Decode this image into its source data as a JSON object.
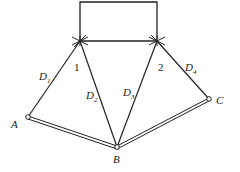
{
  "diagram": {
    "nodes": {
      "n1": {
        "label": "1",
        "x": 80,
        "y": 41
      },
      "n2": {
        "label": "2",
        "x": 157,
        "y": 41
      },
      "A": {
        "label": "A",
        "x": 28,
        "y": 117
      },
      "B": {
        "label": "B",
        "x": 117,
        "y": 147
      },
      "C": {
        "label": "C",
        "x": 209,
        "y": 99
      }
    },
    "members": [
      {
        "name": "D",
        "sub": "1",
        "from": "A",
        "to": "n1"
      },
      {
        "name": "D",
        "sub": "2",
        "from": "B",
        "to": "n1"
      },
      {
        "name": "D",
        "sub": "3",
        "from": "B",
        "to": "n2"
      },
      {
        "name": "D",
        "sub": "4",
        "from": "C",
        "to": "n2"
      }
    ],
    "labels": {
      "node1": "1",
      "node2": "2",
      "A": "A",
      "B": "B",
      "C": "C",
      "D1": "D",
      "D1_sub": "1",
      "D2": "D",
      "D2_sub": "2",
      "D3": "D",
      "D3_sub": "3",
      "D4": "D",
      "D4_sub": "4"
    },
    "colors": {
      "line": "#222222",
      "background": "#ffffff"
    }
  }
}
